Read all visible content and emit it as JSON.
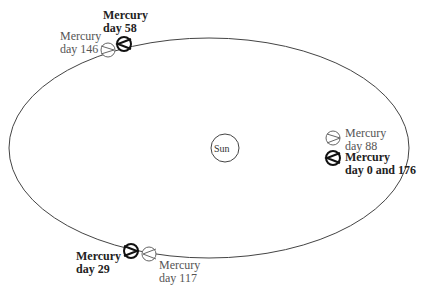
{
  "diagram": {
    "sun": {
      "label": "Sun"
    },
    "positions": [
      {
        "id": "day58",
        "line1": "Mercury",
        "line2": "day 58",
        "emphasis": "bold"
      },
      {
        "id": "day146",
        "line1": "Mercury",
        "line2": "day 146",
        "emphasis": "normal"
      },
      {
        "id": "day88",
        "line1": "Mercury",
        "line2": "day 88",
        "emphasis": "normal"
      },
      {
        "id": "day0_176",
        "line1": "Mercury",
        "line2": "day 0 and 176",
        "emphasis": "bold"
      },
      {
        "id": "day29",
        "line1": "Mercury",
        "line2": "day 29",
        "emphasis": "bold"
      },
      {
        "id": "day117",
        "line1": "Mercury",
        "line2": "day 117",
        "emphasis": "normal"
      }
    ],
    "colors": {
      "orbit": "#444444",
      "bold_planet": "#111111",
      "light_planet": "#555555"
    }
  }
}
